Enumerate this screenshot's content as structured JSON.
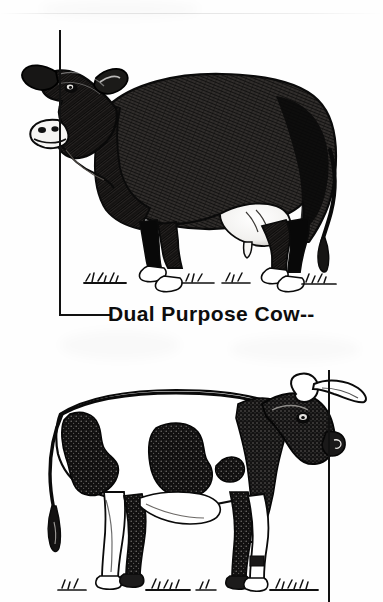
{
  "page": {
    "width": 383,
    "height": 602,
    "background_color": "#fefefe",
    "ink_color": "#111111",
    "media": "scanned-line-illustration"
  },
  "caption": {
    "text": "Dual Purpose Cow--",
    "color": "#0d0d0d",
    "x": 108,
    "y": 303,
    "font_size_px": 21,
    "weight": "bold"
  },
  "leaders": [
    {
      "name": "top-figure-leader",
      "shape": "L",
      "vertical": {
        "x": 59,
        "y_top": 30,
        "y_bottom": 316,
        "width": 2
      },
      "horizontal": {
        "x_left": 59,
        "x_right": 112,
        "y": 314,
        "height": 2
      }
    },
    {
      "name": "bottom-figure-leader",
      "shape": "vertical",
      "vertical": {
        "x": 328,
        "y_top": 370,
        "y_bottom": 602,
        "width": 2
      }
    }
  ],
  "figures": [
    {
      "name": "dual-purpose-cow-dark",
      "label": "Dual Purpose Cow",
      "description": "Solid dark-coated beef-and-milk type cow standing in left profile",
      "facing": "left",
      "coat_pattern": "solid dark",
      "coat_color": "#2c2a28",
      "has_udder": true,
      "udder_color": "#fdfdfd",
      "horned": false,
      "hoof_color": "#ffffff",
      "ground_detail": "grass tufts",
      "bounds": {
        "x": 22,
        "y": 55,
        "width": 316,
        "height": 230
      }
    },
    {
      "name": "spotted-cow-horned",
      "label": "Spotted Cow",
      "description": "Black and white spotted horned cow standing in right profile",
      "facing": "right",
      "coat_pattern": "black and white spotted",
      "coat_color": "#18171a",
      "body_color": "#ffffff",
      "has_udder": true,
      "udder_color": "#ffffff",
      "horned": true,
      "horn_color": "#ffffff",
      "hoof_color": "#1a1a1a",
      "ground_detail": "grass tufts",
      "bounds": {
        "x": 32,
        "y": 388,
        "width": 310,
        "height": 212
      }
    }
  ],
  "artifacts": {
    "scan_streak_y": 13,
    "scan_streak_opacity": 0.1
  }
}
